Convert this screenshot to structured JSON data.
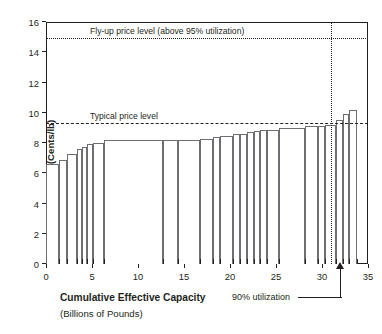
{
  "chart_data": {
    "type": "bar",
    "title": "",
    "xlabel": "Cumulative Effective Capacity",
    "xlabel_sub": "(Billions of Pounds)",
    "ylabel": "Cash Cost (Cents/lb)",
    "xlim": [
      0,
      35
    ],
    "ylim": [
      0,
      16
    ],
    "xticks": [
      0,
      5,
      10,
      15,
      20,
      25,
      30,
      35
    ],
    "yticks": [
      0,
      2,
      4,
      6,
      8,
      10,
      12,
      14,
      16
    ],
    "grid": false,
    "legend": "none",
    "bar_orientation": "vertical",
    "bar_x_units": "cumulative capacity (billions of pounds)",
    "bar_value_units": "cash cost (cents per pound)",
    "bars": [
      {
        "x_start": 0.0,
        "x_end": 1.45,
        "value": 6.62
      },
      {
        "x_start": 1.45,
        "x_end": 2.3,
        "value": 6.85
      },
      {
        "x_start": 2.3,
        "x_end": 3.35,
        "value": 7.25
      },
      {
        "x_start": 3.35,
        "x_end": 3.95,
        "value": 7.62
      },
      {
        "x_start": 3.95,
        "x_end": 4.45,
        "value": 7.72
      },
      {
        "x_start": 4.45,
        "x_end": 5.1,
        "value": 7.93
      },
      {
        "x_start": 5.1,
        "x_end": 6.35,
        "value": 7.98
      },
      {
        "x_start": 6.35,
        "x_end": 12.7,
        "value": 8.18
      },
      {
        "x_start": 12.7,
        "x_end": 14.4,
        "value": 8.18
      },
      {
        "x_start": 14.4,
        "x_end": 16.75,
        "value": 8.2
      },
      {
        "x_start": 16.75,
        "x_end": 18.1,
        "value": 8.28
      },
      {
        "x_start": 18.1,
        "x_end": 18.95,
        "value": 8.38
      },
      {
        "x_start": 18.95,
        "x_end": 20.3,
        "value": 8.48
      },
      {
        "x_start": 20.3,
        "x_end": 21.05,
        "value": 8.58
      },
      {
        "x_start": 21.05,
        "x_end": 21.8,
        "value": 8.62
      },
      {
        "x_start": 21.8,
        "x_end": 22.6,
        "value": 8.75
      },
      {
        "x_start": 22.6,
        "x_end": 23.3,
        "value": 8.78
      },
      {
        "x_start": 23.3,
        "x_end": 24.0,
        "value": 8.85
      },
      {
        "x_start": 24.0,
        "x_end": 25.35,
        "value": 8.88
      },
      {
        "x_start": 25.35,
        "x_end": 28.1,
        "value": 9.0
      },
      {
        "x_start": 28.1,
        "x_end": 29.6,
        "value": 9.1
      },
      {
        "x_start": 29.6,
        "x_end": 30.3,
        "value": 9.15
      },
      {
        "x_start": 30.3,
        "x_end": 31.55,
        "value": 9.22
      },
      {
        "x_start": 31.55,
        "x_end": 32.25,
        "value": 9.5
      },
      {
        "x_start": 32.25,
        "x_end": 32.95,
        "value": 9.9
      },
      {
        "x_start": 32.95,
        "x_end": 33.85,
        "value": 10.15
      }
    ],
    "reference_lines": [
      {
        "id": "flyup",
        "label": "Fly-up price level (above 95% utilization)",
        "value": 14.85,
        "style": "dotted"
      },
      {
        "id": "typical",
        "label": "Typical price level",
        "value": 9.25,
        "style": "dashed"
      }
    ],
    "markers": [
      {
        "id": "utilization-90",
        "label": "90% utilization",
        "x": 31.0,
        "style": "dotted-vertical-with-arrow"
      }
    ]
  }
}
